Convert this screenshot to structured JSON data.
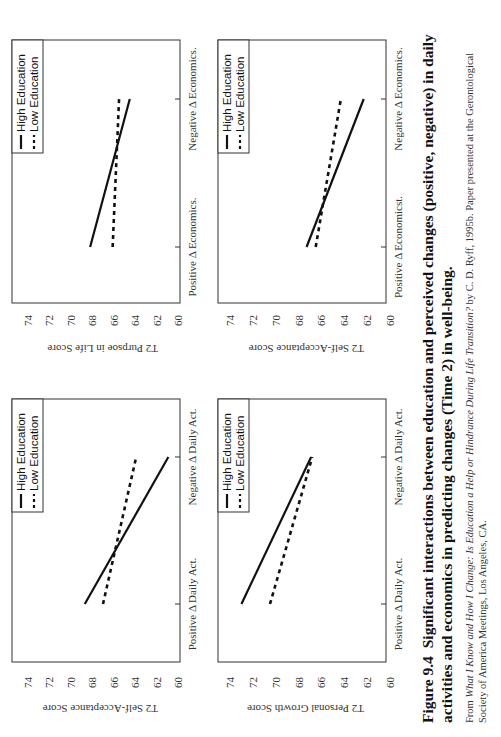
{
  "figure": {
    "number": "Figure 9.4",
    "title": "Significant interactions between education and perceived changes (positive, negative) in daily activities and economics in predicting changes (Time 2) in well-being.",
    "source_prefix": "From ",
    "source_italic": "What I Know and How I Change: Is Education a Help or Hindrance During Life Transition?",
    "source_suffix": " by C. D. Ryff, 1995b. Paper presented at the Gerontological Society of America Meetings, Los Angeles, CA."
  },
  "legend": {
    "high": "High Education",
    "low": "Low Education"
  },
  "y_ticks": [
    "74",
    "72",
    "70",
    "68",
    "66",
    "64",
    "62",
    "60"
  ],
  "colors": {
    "line": "#111111",
    "axis": "#333333",
    "background": "#ffffff"
  },
  "chart_data": [
    {
      "type": "line",
      "title": "",
      "ylabel": "T2 Self-Acceptance Score",
      "xlabel": "",
      "categories": [
        "Positive Δ Daily Act.",
        "Negative Δ Daily Act."
      ],
      "ylim": [
        60,
        74
      ],
      "yticks": [
        60,
        62,
        64,
        66,
        68,
        70,
        72,
        74
      ],
      "grid": false,
      "legend_position": "top-right",
      "series": [
        {
          "name": "High Education",
          "style": "solid",
          "values": [
            68.7,
            60.9
          ]
        },
        {
          "name": "Low Education",
          "style": "dashed",
          "values": [
            67.0,
            63.9
          ]
        }
      ]
    },
    {
      "type": "line",
      "title": "",
      "ylabel": "T2 Purpsoe in Life Score",
      "xlabel": "",
      "categories": [
        "Positive Δ Economics.",
        "Negative Δ Economics."
      ],
      "ylim": [
        60,
        74
      ],
      "yticks": [
        60,
        62,
        64,
        66,
        68,
        70,
        72,
        74
      ],
      "grid": false,
      "legend_position": "top-right",
      "series": [
        {
          "name": "High Education",
          "style": "solid",
          "values": [
            68.2,
            64.5
          ]
        },
        {
          "name": "Low Education",
          "style": "dashed",
          "values": [
            66.1,
            65.5
          ]
        }
      ]
    },
    {
      "type": "line",
      "title": "",
      "ylabel": "T2 Personal Growth Score",
      "xlabel": "",
      "categories": [
        "Positive Δ Daily Act.",
        "Negative Δ Daily Act."
      ],
      "ylim": [
        60,
        74
      ],
      "yticks": [
        60,
        62,
        64,
        66,
        68,
        70,
        72,
        74
      ],
      "grid": false,
      "legend_position": "top-right",
      "series": [
        {
          "name": "High Education",
          "style": "solid",
          "values": [
            73.0,
            66.9
          ]
        },
        {
          "name": "Low Education",
          "style": "dashed",
          "values": [
            70.5,
            66.8
          ]
        }
      ]
    },
    {
      "type": "line",
      "title": "",
      "ylabel": "T2 Self-Acceptance Score",
      "xlabel": "",
      "categories": [
        "Positive Δ Economicst.",
        "Negative Δ Economics."
      ],
      "ylim": [
        60,
        74
      ],
      "yticks": [
        60,
        62,
        64,
        66,
        68,
        70,
        72,
        74
      ],
      "grid": false,
      "legend_position": "top-right",
      "series": [
        {
          "name": "High Education",
          "style": "solid",
          "values": [
            67.3,
            62.3
          ]
        },
        {
          "name": "Low Education",
          "style": "dashed",
          "values": [
            66.5,
            64.3
          ]
        }
      ]
    }
  ]
}
